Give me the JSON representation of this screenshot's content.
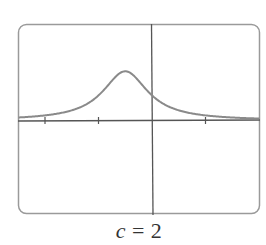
{
  "chart_data": {
    "type": "line",
    "title": "",
    "caption": {
      "variable": "c",
      "equals": " = ",
      "value": "2",
      "full": "c = 2"
    },
    "xlabel": "",
    "ylabel": "",
    "xlim": [
      -2.5,
      2.0
    ],
    "ylim": [
      -1.75,
      1.8
    ],
    "x_ticks": [
      -2,
      -1,
      0,
      1
    ],
    "x_tick_labels": [],
    "grid": false,
    "legend": null,
    "frame": "rounded-rectangle",
    "series": [
      {
        "name": "f(x)",
        "peak": {
          "x": -0.5,
          "y": 0.92
        },
        "x": [
          -2.5,
          -2.0,
          -1.5,
          -1.25,
          -1.0,
          -0.75,
          -0.5,
          -0.25,
          0.0,
          0.25,
          0.5,
          1.0,
          1.5,
          2.0
        ],
        "values": [
          0.06,
          0.1,
          0.19,
          0.29,
          0.47,
          0.74,
          0.92,
          0.74,
          0.47,
          0.29,
          0.19,
          0.1,
          0.06,
          0.04
        ]
      }
    ],
    "colors": {
      "curve": "#8a8a8a",
      "axes": "#555555",
      "frame": "#9a9a9a"
    }
  }
}
